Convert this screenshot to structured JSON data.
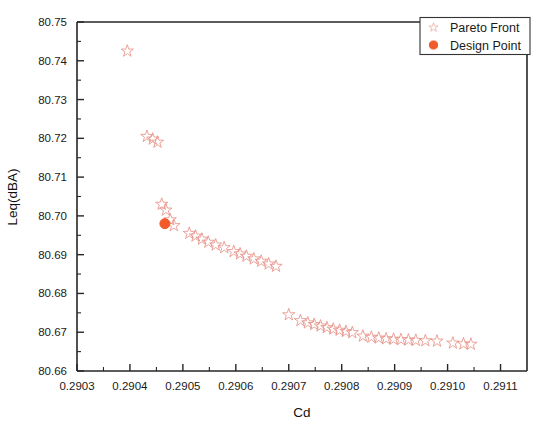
{
  "chart_data": {
    "type": "scatter",
    "title": "",
    "xlabel": "Cd",
    "ylabel": "Leq(dBA)",
    "xlim": [
      0.2903,
      0.29115
    ],
    "ylim": [
      80.66,
      80.75
    ],
    "xticks": [
      "0.2903",
      "0.2904",
      "0.2905",
      "0.2906",
      "0.2907",
      "0.2908",
      "0.2909",
      "0.2910",
      "0.2911"
    ],
    "xtick_values": [
      0.2903,
      0.2904,
      0.2905,
      0.2906,
      0.2907,
      0.2908,
      0.2909,
      0.291,
      0.2911
    ],
    "yticks": [
      "80.66",
      "80.67",
      "80.68",
      "80.69",
      "80.70",
      "80.71",
      "80.72",
      "80.73",
      "80.74",
      "80.75"
    ],
    "ytick_values": [
      80.66,
      80.67,
      80.68,
      80.69,
      80.7,
      80.71,
      80.72,
      80.73,
      80.74,
      80.75
    ],
    "grid": false,
    "legend_position": "top-right",
    "series": [
      {
        "name": "Pareto Front",
        "marker": "star-open",
        "color": "#e8948a",
        "points": [
          [
            0.290395,
            80.7425
          ],
          [
            0.290432,
            80.7205
          ],
          [
            0.290443,
            80.7198
          ],
          [
            0.290452,
            80.719
          ],
          [
            0.29046,
            80.703
          ],
          [
            0.290468,
            80.7015
          ],
          [
            0.290476,
            80.699
          ],
          [
            0.290483,
            80.6975
          ],
          [
            0.290512,
            80.6955
          ],
          [
            0.290524,
            80.6948
          ],
          [
            0.290536,
            80.694
          ],
          [
            0.290548,
            80.6932
          ],
          [
            0.290562,
            80.6925
          ],
          [
            0.290578,
            80.6918
          ],
          [
            0.290596,
            80.6908
          ],
          [
            0.290608,
            80.6902
          ],
          [
            0.29062,
            80.6896
          ],
          [
            0.290634,
            80.6889
          ],
          [
            0.290648,
            80.6883
          ],
          [
            0.290662,
            80.6876
          ],
          [
            0.290676,
            80.687
          ],
          [
            0.2907,
            80.6745
          ],
          [
            0.290722,
            80.673
          ],
          [
            0.290736,
            80.6724
          ],
          [
            0.290748,
            80.672
          ],
          [
            0.29076,
            80.6716
          ],
          [
            0.290772,
            80.6712
          ],
          [
            0.290784,
            80.6708
          ],
          [
            0.290796,
            80.6705
          ],
          [
            0.290808,
            80.6702
          ],
          [
            0.29082,
            80.6699
          ],
          [
            0.29084,
            80.669
          ],
          [
            0.290856,
            80.6687
          ],
          [
            0.29087,
            80.6685
          ],
          [
            0.290884,
            80.6683
          ],
          [
            0.290898,
            80.6682
          ],
          [
            0.290912,
            80.6681
          ],
          [
            0.290926,
            80.668
          ],
          [
            0.29094,
            80.6679
          ],
          [
            0.290958,
            80.6678
          ],
          [
            0.29098,
            80.6677
          ],
          [
            0.29101,
            80.6672
          ],
          [
            0.29103,
            80.667
          ],
          [
            0.291044,
            80.6669
          ]
        ]
      },
      {
        "name": "Design Point",
        "marker": "circle-filled",
        "color": "#f15a29",
        "points": [
          [
            0.290466,
            80.698
          ]
        ]
      }
    ]
  },
  "legend": {
    "entries": [
      {
        "label": "Pareto Front",
        "marker": "star-open-icon"
      },
      {
        "label": "Design Point",
        "marker": "circle-filled-icon"
      }
    ]
  }
}
